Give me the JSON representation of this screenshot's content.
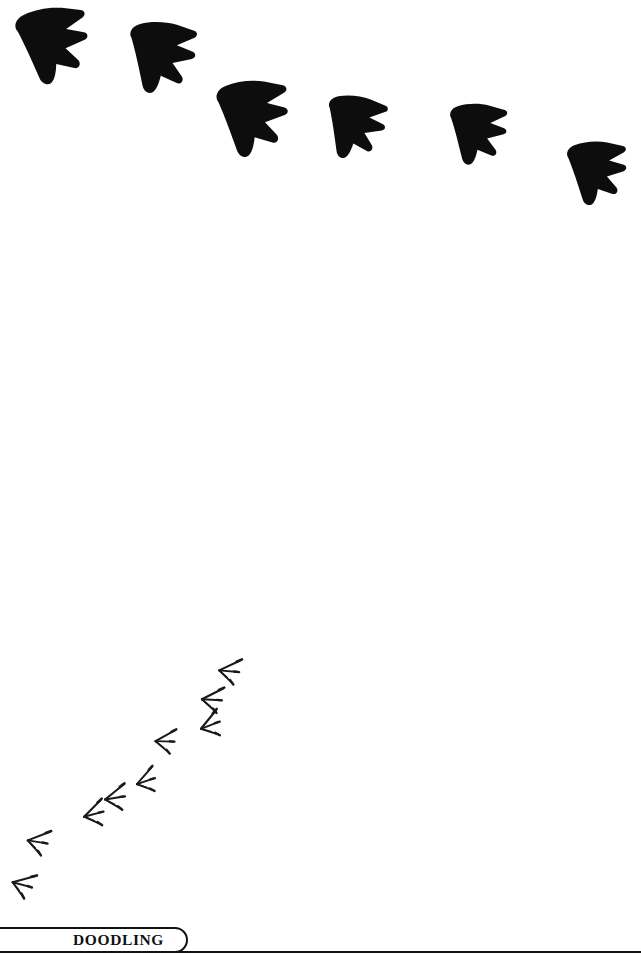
{
  "page": {
    "background_color": "#ffffff",
    "ink_color": "#111111",
    "width": 641,
    "height": 955
  },
  "footer": {
    "tab_label": "DOODLING",
    "tab_shape": "rounded-right-tab",
    "rule_color": "#111111"
  },
  "artwork": {
    "title": "dinosaur and bird footprint doodle",
    "large_tracks": {
      "name": "large-dinosaur-footprints",
      "count": 6,
      "style": "solid-black-silhouette",
      "fill_color": "#0d0d0d",
      "description": "Row of six large solid black three-toed tracks arcing from upper-left down to the right edge",
      "items": [
        {
          "id": "large-track-1",
          "x": 12,
          "y": 18,
          "w": 70,
          "h": 78,
          "rotate": -18,
          "scale": 1.02
        },
        {
          "id": "large-track-2",
          "x": 128,
          "y": 22,
          "w": 66,
          "h": 70,
          "rotate": -6,
          "scale": 0.96
        },
        {
          "id": "large-track-3",
          "x": 213,
          "y": 88,
          "w": 70,
          "h": 76,
          "rotate": -14,
          "scale": 1.0
        },
        {
          "id": "large-track-4",
          "x": 330,
          "y": 96,
          "w": 62,
          "h": 58,
          "rotate": -2,
          "scale": 0.9
        },
        {
          "id": "large-track-5",
          "x": 450,
          "y": 107,
          "w": 58,
          "h": 62,
          "rotate": -8,
          "scale": 0.86
        },
        {
          "id": "large-track-6",
          "x": 566,
          "y": 147,
          "w": 62,
          "h": 62,
          "rotate": -12,
          "scale": 0.88
        }
      ]
    },
    "small_tracks": {
      "name": "small-bird-footprints",
      "count": 9,
      "style": "thin-line-drawing",
      "stroke_color": "#1a1a1a",
      "description": "Trail of nine small thin bird tracks running diagonally from lower-left up to centre-right",
      "items": [
        {
          "id": "small-track-1",
          "x": 230,
          "y": 661,
          "scale": 1.0,
          "rotate": 8
        },
        {
          "id": "small-track-2",
          "x": 212,
          "y": 690,
          "scale": 1.0,
          "rotate": 6
        },
        {
          "id": "small-track-3",
          "x": 203,
          "y": 721,
          "scale": 1.0,
          "rotate": 62
        },
        {
          "id": "small-track-4",
          "x": 164,
          "y": 733,
          "scale": 0.95,
          "rotate": 4
        },
        {
          "id": "small-track-5",
          "x": 140,
          "y": 778,
          "scale": 0.95,
          "rotate": 52
        },
        {
          "id": "small-track-6",
          "x": 110,
          "y": 791,
          "scale": 1.0,
          "rotate": 40
        },
        {
          "id": "small-track-7",
          "x": 87,
          "y": 809,
          "scale": 1.0,
          "rotate": 58
        },
        {
          "id": "small-track-8",
          "x": 39,
          "y": 831,
          "scale": 1.0,
          "rotate": 12
        },
        {
          "id": "small-track-9",
          "x": 26,
          "y": 873,
          "scale": 1.0,
          "rotate": 20
        }
      ]
    }
  }
}
